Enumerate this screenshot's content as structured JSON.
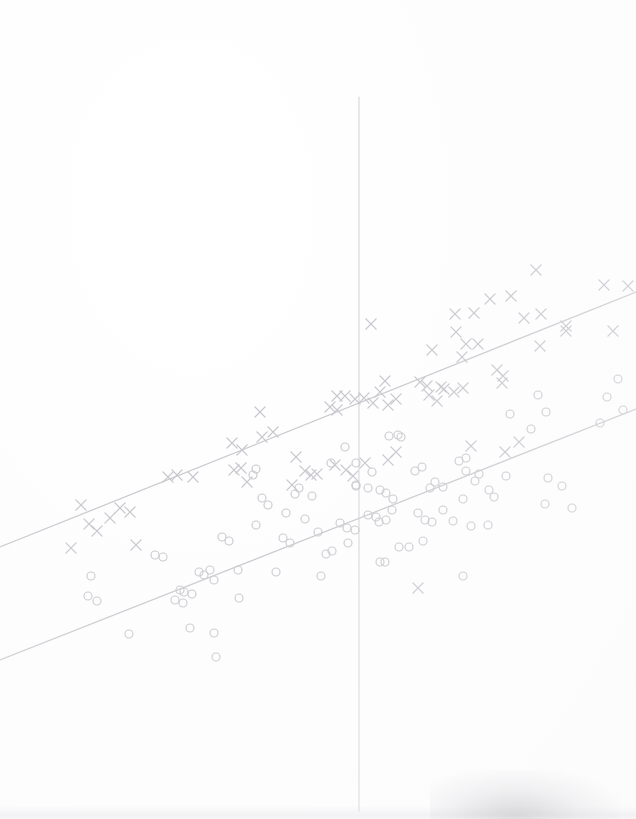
{
  "chart_data": {
    "type": "scatter",
    "title": "",
    "subtitle": "",
    "xlabel": "",
    "ylabel": "",
    "xlim": [
      0,
      636
    ],
    "ylim": [
      819,
      0
    ],
    "grid": false,
    "legend": null,
    "axis": {
      "vertical_axis_x": 359,
      "vertical_axis_y_start": 97,
      "vertical_axis_y_end": 811,
      "color": "#cfcfd4",
      "width": 1.1
    },
    "lines": [
      {
        "name": "upper-regression-line",
        "marker_group": "cross",
        "color": "#c2c2c8",
        "width": 1.3,
        "x1": 0,
        "y1": 547,
        "x2": 636,
        "y2": 292
      },
      {
        "name": "lower-regression-line",
        "marker_group": "circle",
        "color": "#c2c2c8",
        "width": 1.3,
        "x1": 0,
        "y1": 660,
        "x2": 636,
        "y2": 409
      }
    ],
    "series": [
      {
        "name": "cross-group",
        "marker": "x",
        "color": "#bcbcc3",
        "size": 9,
        "count": 74,
        "points": [
          [
            536,
            270
          ],
          [
            604,
            285
          ],
          [
            628,
            286
          ],
          [
            371,
            324
          ],
          [
            455,
            314
          ],
          [
            474,
            313
          ],
          [
            490,
            299
          ],
          [
            511,
            296
          ],
          [
            524,
            318
          ],
          [
            541,
            314
          ],
          [
            613,
            331
          ],
          [
            566,
            326
          ],
          [
            432,
            350
          ],
          [
            462,
            357
          ],
          [
            478,
            344
          ],
          [
            497,
            370
          ],
          [
            503,
            376
          ],
          [
            540,
            346
          ],
          [
            456,
            332
          ],
          [
            466,
            344
          ],
          [
            385,
            381
          ],
          [
            420,
            382
          ],
          [
            441,
            387
          ],
          [
            454,
            392
          ],
          [
            463,
            388
          ],
          [
            502,
            383
          ],
          [
            566,
            331
          ],
          [
            337,
            396
          ],
          [
            345,
            396
          ],
          [
            355,
            399
          ],
          [
            364,
            398
          ],
          [
            373,
            403
          ],
          [
            380,
            392
          ],
          [
            388,
            405
          ],
          [
            396,
            399
          ],
          [
            429,
            395
          ],
          [
            437,
            401
          ],
          [
            427,
            386
          ],
          [
            444,
            389
          ],
          [
            330,
            407
          ],
          [
            337,
            410
          ],
          [
            260,
            412
          ],
          [
            262,
            437
          ],
          [
            273,
            432
          ],
          [
            296,
            457
          ],
          [
            305,
            471
          ],
          [
            168,
            477
          ],
          [
            177,
            475
          ],
          [
            193,
            477
          ],
          [
            234,
            470
          ],
          [
            241,
            468
          ],
          [
            247,
            482
          ],
          [
            292,
            485
          ],
          [
            311,
            475
          ],
          [
            317,
            474
          ],
          [
            232,
            443
          ],
          [
            242,
            450
          ],
          [
            335,
            465
          ],
          [
            346,
            470
          ],
          [
            353,
            476
          ],
          [
            365,
            463
          ],
          [
            388,
            460
          ],
          [
            396,
            452
          ],
          [
            471,
            446
          ],
          [
            505,
            452
          ],
          [
            519,
            442
          ],
          [
            120,
            508
          ],
          [
            130,
            512
          ],
          [
            81,
            505
          ],
          [
            89,
            524
          ],
          [
            97,
            531
          ],
          [
            110,
            518
          ],
          [
            71,
            548
          ],
          [
            136,
            545
          ],
          [
            418,
            588
          ]
        ]
      },
      {
        "name": "circle-group",
        "marker": "o",
        "color": "#c0c0c7",
        "size": 8,
        "count": 98,
        "points": [
          [
            618,
            379
          ],
          [
            607,
            397
          ],
          [
            600,
            423
          ],
          [
            623,
            410
          ],
          [
            538,
            395
          ],
          [
            546,
            412
          ],
          [
            510,
            414
          ],
          [
            531,
            429
          ],
          [
            459,
            461
          ],
          [
            466,
            458
          ],
          [
            466,
            471
          ],
          [
            475,
            481
          ],
          [
            479,
            474
          ],
          [
            489,
            490
          ],
          [
            494,
            497
          ],
          [
            463,
            499
          ],
          [
            506,
            476
          ],
          [
            548,
            478
          ],
          [
            545,
            504
          ],
          [
            562,
            486
          ],
          [
            572,
            508
          ],
          [
            389,
            436
          ],
          [
            398,
            435
          ],
          [
            401,
            437
          ],
          [
            356,
            486
          ],
          [
            368,
            488
          ],
          [
            380,
            490
          ],
          [
            386,
            493
          ],
          [
            393,
            499
          ],
          [
            340,
            523
          ],
          [
            347,
            528
          ],
          [
            355,
            530
          ],
          [
            368,
            515
          ],
          [
            376,
            517
          ],
          [
            379,
            522
          ],
          [
            386,
            520
          ],
          [
            418,
            513
          ],
          [
            425,
            520
          ],
          [
            432,
            522
          ],
          [
            443,
            510
          ],
          [
            430,
            488
          ],
          [
            380,
            562
          ],
          [
            399,
            547
          ],
          [
            409,
            547
          ],
          [
            318,
            532
          ],
          [
            305,
            519
          ],
          [
            312,
            496
          ],
          [
            295,
            494
          ],
          [
            299,
            488
          ],
          [
            262,
            498
          ],
          [
            268,
            505
          ],
          [
            256,
            525
          ],
          [
            283,
            538
          ],
          [
            290,
            543
          ],
          [
            286,
            513
          ],
          [
            256,
            469
          ],
          [
            253,
            475
          ],
          [
            222,
            537
          ],
          [
            229,
            541
          ],
          [
            210,
            570
          ],
          [
            199,
            572
          ],
          [
            204,
            575
          ],
          [
            214,
            580
          ],
          [
            180,
            590
          ],
          [
            184,
            592
          ],
          [
            192,
            594
          ],
          [
            155,
            555
          ],
          [
            163,
            557
          ],
          [
            175,
            600
          ],
          [
            183,
            603
          ],
          [
            91,
            576
          ],
          [
            88,
            596
          ],
          [
            97,
            601
          ],
          [
            129,
            634
          ],
          [
            190,
            628
          ],
          [
            214,
            633
          ],
          [
            216,
            657
          ],
          [
            276,
            572
          ],
          [
            238,
            570
          ],
          [
            239,
            598
          ],
          [
            321,
            576
          ],
          [
            326,
            554
          ],
          [
            332,
            551
          ],
          [
            356,
            485
          ],
          [
            348,
            543
          ],
          [
            463,
            576
          ],
          [
            488,
            525
          ],
          [
            435,
            482
          ],
          [
            443,
            487
          ],
          [
            372,
            472
          ],
          [
            356,
            463
          ],
          [
            415,
            471
          ],
          [
            422,
            467
          ],
          [
            331,
            463
          ],
          [
            345,
            447
          ],
          [
            453,
            521
          ],
          [
            471,
            526
          ],
          [
            385,
            562
          ],
          [
            392,
            510
          ],
          [
            423,
            541
          ]
        ]
      }
    ],
    "annotations": []
  },
  "colors": {
    "background": "#ffffff",
    "marker": "#bcbcc3",
    "line": "#c2c2c8",
    "axis": "#cfcfd4"
  }
}
